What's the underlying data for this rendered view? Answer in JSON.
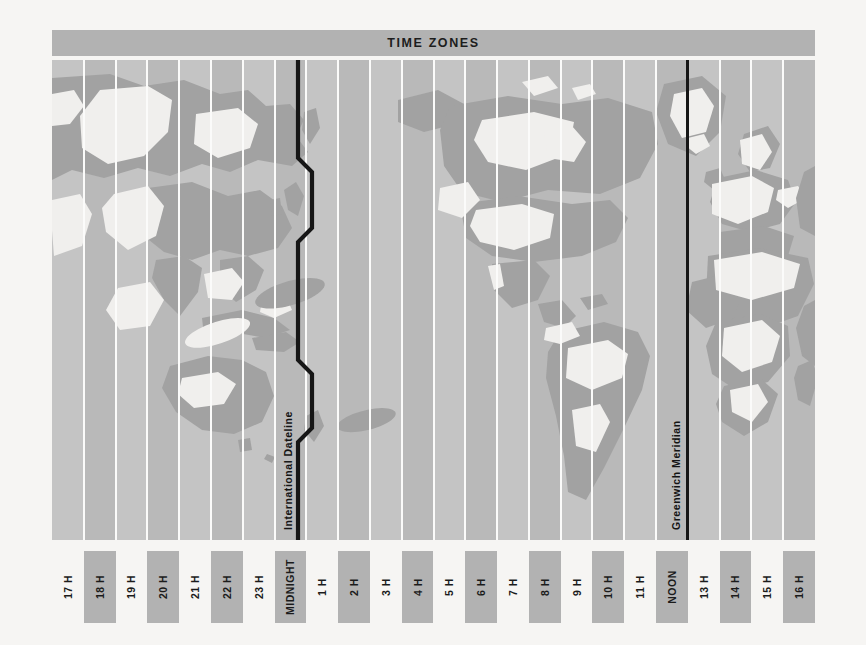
{
  "header": {
    "title": "TIME ZONES",
    "bar_color": "#b2b2b2"
  },
  "map": {
    "ocean_color": "#c0c0c0",
    "band_light_color": "#c4c4c4",
    "band_dark_color": "#b9b9b9",
    "band_divider_color": "#fbfbfa",
    "land_dark_color": "#a2a2a2",
    "land_light_color": "#f0efed",
    "meridian_color": "#161616",
    "band_count": 24,
    "dateline": {
      "label": "International Dateline",
      "name": "international-dateline"
    },
    "greenwich": {
      "label": "Greenwich Meridian",
      "name": "greenwich-meridian"
    }
  },
  "zone_labels": [
    {
      "label": "17 H",
      "shaded": false
    },
    {
      "label": "18 H",
      "shaded": true
    },
    {
      "label": "19 H",
      "shaded": false
    },
    {
      "label": "20 H",
      "shaded": true
    },
    {
      "label": "21 H",
      "shaded": false
    },
    {
      "label": "22 H",
      "shaded": true
    },
    {
      "label": "23 H",
      "shaded": false
    },
    {
      "label": "MIDNIGHT",
      "shaded": true
    },
    {
      "label": "1 H",
      "shaded": false
    },
    {
      "label": "2 H",
      "shaded": true
    },
    {
      "label": "3 H",
      "shaded": false
    },
    {
      "label": "4 H",
      "shaded": true
    },
    {
      "label": "5 H",
      "shaded": false
    },
    {
      "label": "6 H",
      "shaded": true
    },
    {
      "label": "7 H",
      "shaded": false
    },
    {
      "label": "8 H",
      "shaded": true
    },
    {
      "label": "9 H",
      "shaded": false
    },
    {
      "label": "10 H",
      "shaded": true
    },
    {
      "label": "11 H",
      "shaded": false
    },
    {
      "label": "NOON",
      "shaded": true
    },
    {
      "label": "13 H",
      "shaded": false
    },
    {
      "label": "14 H",
      "shaded": true
    },
    {
      "label": "15 H",
      "shaded": false
    },
    {
      "label": "16 H",
      "shaded": true
    }
  ]
}
